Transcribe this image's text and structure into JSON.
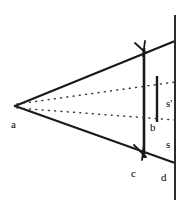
{
  "figure": {
    "type": "optics-ray-diagram",
    "background_color": "#ffffff",
    "stroke_color": "#1a1a1a",
    "width": 187,
    "height": 212,
    "labels": [
      {
        "id": "a",
        "text": "a",
        "x": 11,
        "y": 119,
        "role": "apex-point"
      },
      {
        "id": "b",
        "text": "b",
        "x": 150,
        "y": 122,
        "role": "interior-point"
      },
      {
        "id": "c",
        "text": "c",
        "x": 131,
        "y": 168,
        "role": "aperture-bottom-point"
      },
      {
        "id": "d",
        "text": "d",
        "x": 161,
        "y": 172,
        "role": "screen-bottom-point"
      },
      {
        "id": "s",
        "text": "s",
        "x": 166,
        "y": 139,
        "role": "distance-s"
      },
      {
        "id": "s-prime",
        "text": "s'",
        "x": 166,
        "y": 98,
        "role": "distance-s-prime"
      }
    ],
    "geometry": {
      "apex": {
        "x": 15,
        "y": 106
      },
      "upper_ray": {
        "x1": 15,
        "y1": 106,
        "x2": 175,
        "y2": 41
      },
      "lower_ray": {
        "x1": 15,
        "y1": 106,
        "x2": 175,
        "y2": 163
      },
      "aperture_line": {
        "x": 144,
        "y1": 48,
        "y2": 158
      },
      "screen_line": {
        "x": 175,
        "y1": 15,
        "y2": 200
      },
      "image_segment": {
        "x": 157,
        "y1": 76,
        "y2": 122
      },
      "dotted_ray_upper": {
        "x1": 17,
        "y1": 104,
        "x2": 175,
        "y2": 82
      },
      "dotted_ray_lower": {
        "x1": 17,
        "y1": 108,
        "x2": 175,
        "y2": 120
      },
      "arrowheads": [
        {
          "on": "upper_ray",
          "x": 143,
          "y": 50
        },
        {
          "on": "lower_ray",
          "x": 143,
          "y": 155
        }
      ]
    }
  }
}
